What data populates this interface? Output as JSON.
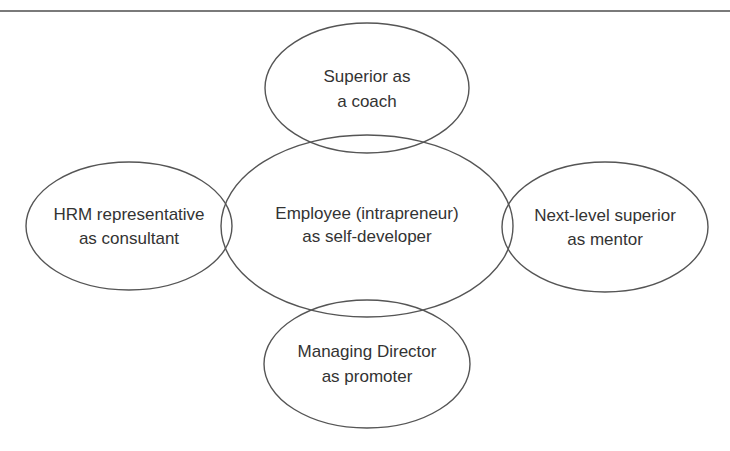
{
  "diagram": {
    "type": "role-network",
    "center": {
      "id": "employee",
      "line1": "Employee (intrapreneur)",
      "line2": "as self-developer",
      "shape": {
        "cx": 367,
        "cy": 226,
        "rx": 146,
        "ry": 91
      },
      "text_y": [
        219,
        242
      ]
    },
    "nodes": [
      {
        "id": "superior",
        "position": "top",
        "line1": "Superior as",
        "line2": "a coach",
        "shape": {
          "cx": 367,
          "cy": 88,
          "rx": 102,
          "ry": 65
        },
        "text_y": [
          82,
          107
        ]
      },
      {
        "id": "hrm",
        "position": "left",
        "line1": "HRM representative",
        "line2": "as consultant",
        "shape": {
          "cx": 129,
          "cy": 226,
          "rx": 103,
          "ry": 64
        },
        "text_y": [
          220,
          244
        ]
      },
      {
        "id": "next-level",
        "position": "right",
        "line1": "Next-level superior",
        "line2": "as mentor",
        "shape": {
          "cx": 605,
          "cy": 227,
          "rx": 103,
          "ry": 65
        },
        "text_y": [
          221,
          245
        ]
      },
      {
        "id": "managing-director",
        "position": "bottom",
        "line1": "Managing Director",
        "line2": "as promoter",
        "shape": {
          "cx": 367,
          "cy": 364,
          "rx": 103,
          "ry": 64
        },
        "text_y": [
          357,
          382
        ]
      }
    ]
  },
  "colors": {
    "stroke": "#555555",
    "text": "#333333",
    "rule": "#7a7a7a",
    "background": "#ffffff"
  }
}
